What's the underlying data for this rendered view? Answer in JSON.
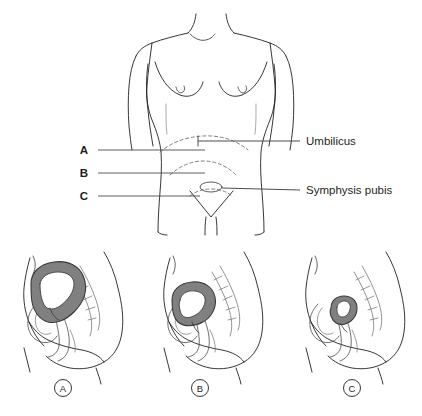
{
  "figure": {
    "top_panel": {
      "view": "anterior-female-torso",
      "left_labels": [
        {
          "id": "A",
          "text": "A",
          "y": 150,
          "line_x_end": 205
        },
        {
          "id": "B",
          "text": "B",
          "y": 173,
          "line_x_end": 205
        },
        {
          "id": "C",
          "text": "C",
          "y": 196,
          "line_x_end": 200
        }
      ],
      "right_labels": [
        {
          "id": "umbilicus",
          "text": "Umbilicus",
          "y": 141
        },
        {
          "id": "symphysis",
          "text": "Symphysis pubis",
          "y": 190
        }
      ]
    },
    "bottom_panels": [
      {
        "id": "A",
        "label": "A",
        "caption_x": 63,
        "uterus_size": "large",
        "description": "Uterus immediately after birth, fundus at umbilicus"
      },
      {
        "id": "B",
        "label": "B",
        "caption_x": 200,
        "uterus_size": "medium",
        "description": "Uterus partially involuted, fundus midway to symphysis"
      },
      {
        "id": "C",
        "label": "C",
        "caption_x": 352,
        "uterus_size": "small",
        "description": "Uterus fully involuted, within the pelvis"
      }
    ],
    "colors": {
      "outline": "#231f20",
      "uterus_fill": "#808080",
      "uterus_stroke": "#3a3a3a",
      "leader_line": "#4d4d4d",
      "dashed_line": "#6b6b6b",
      "background": "#ffffff"
    }
  }
}
